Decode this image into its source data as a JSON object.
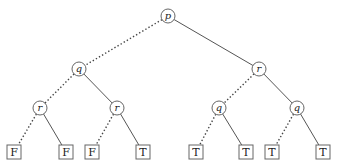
{
  "diagram": {
    "type": "binary-decision-tree",
    "legend": {
      "dashed_edge": "low (false) branch",
      "solid_edge": "high (true) branch"
    },
    "nodes": [
      {
        "id": "n0",
        "label": "p",
        "kind": "decision",
        "x": 168,
        "y": 16
      },
      {
        "id": "n1",
        "label": "q",
        "kind": "decision",
        "x": 79,
        "y": 69
      },
      {
        "id": "n2",
        "label": "r",
        "kind": "decision",
        "x": 259,
        "y": 69
      },
      {
        "id": "n3",
        "label": "r",
        "kind": "decision",
        "x": 40,
        "y": 108
      },
      {
        "id": "n4",
        "label": "r",
        "kind": "decision",
        "x": 117,
        "y": 108
      },
      {
        "id": "n5",
        "label": "q",
        "kind": "decision",
        "x": 219,
        "y": 108
      },
      {
        "id": "n6",
        "label": "q",
        "kind": "decision",
        "x": 297,
        "y": 108
      },
      {
        "id": "l0",
        "label": "F",
        "kind": "leaf",
        "x": 14,
        "y": 152
      },
      {
        "id": "l1",
        "label": "F",
        "kind": "leaf",
        "x": 66,
        "y": 152
      },
      {
        "id": "l2",
        "label": "F",
        "kind": "leaf",
        "x": 92,
        "y": 152
      },
      {
        "id": "l3",
        "label": "T",
        "kind": "leaf",
        "x": 143,
        "y": 152
      },
      {
        "id": "l4",
        "label": "T",
        "kind": "leaf",
        "x": 196,
        "y": 152
      },
      {
        "id": "l5",
        "label": "T",
        "kind": "leaf",
        "x": 246,
        "y": 152
      },
      {
        "id": "l6",
        "label": "T",
        "kind": "leaf",
        "x": 272,
        "y": 152
      },
      {
        "id": "l7",
        "label": "T",
        "kind": "leaf",
        "x": 323,
        "y": 152
      }
    ],
    "edges": [
      {
        "from": "n0",
        "to": "n1",
        "style": "dashed"
      },
      {
        "from": "n0",
        "to": "n2",
        "style": "solid"
      },
      {
        "from": "n1",
        "to": "n3",
        "style": "dashed"
      },
      {
        "from": "n1",
        "to": "n4",
        "style": "solid"
      },
      {
        "from": "n2",
        "to": "n5",
        "style": "dashed"
      },
      {
        "from": "n2",
        "to": "n6",
        "style": "solid"
      },
      {
        "from": "n3",
        "to": "l0",
        "style": "dashed"
      },
      {
        "from": "n3",
        "to": "l1",
        "style": "solid"
      },
      {
        "from": "n4",
        "to": "l2",
        "style": "dashed"
      },
      {
        "from": "n4",
        "to": "l3",
        "style": "solid"
      },
      {
        "from": "n5",
        "to": "l4",
        "style": "dashed"
      },
      {
        "from": "n5",
        "to": "l5",
        "style": "solid"
      },
      {
        "from": "n6",
        "to": "l6",
        "style": "dashed"
      },
      {
        "from": "n6",
        "to": "l7",
        "style": "solid"
      }
    ],
    "style": {
      "node_radius": 7,
      "leaf_size": 14,
      "stroke_color": "#666666",
      "background": "#ffffff"
    }
  }
}
